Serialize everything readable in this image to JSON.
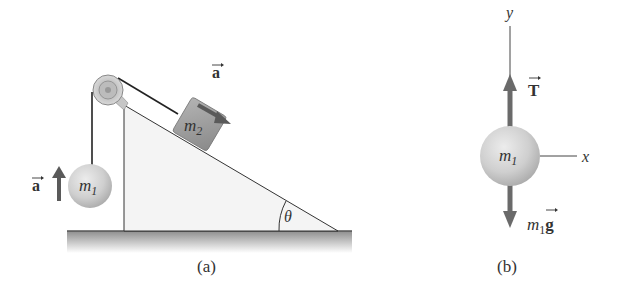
{
  "figure_a": {
    "caption": "(a)",
    "mass_hanging": {
      "label": "m",
      "subscript": "1"
    },
    "mass_incline": {
      "label": "m",
      "subscript": "2"
    },
    "accel_hanging": {
      "label": "a",
      "direction": "up"
    },
    "accel_incline": {
      "label": "a",
      "direction": "down-slope"
    },
    "angle": {
      "label": "θ"
    }
  },
  "figure_b": {
    "caption": "(b)",
    "mass": {
      "label": "m",
      "subscript": "1"
    },
    "axis_y": {
      "label": "y"
    },
    "axis_x": {
      "label": "x"
    },
    "tension": {
      "label": "T",
      "direction": "up"
    },
    "weight": {
      "prefix": "m",
      "subscript": "1",
      "label": "g",
      "direction": "down"
    }
  },
  "colors": {
    "arrow": "#5a5a5a",
    "ball": "#cfcfcf",
    "block": "#9a9a9a",
    "incline": "#f4f4f4",
    "ground": "#a8a8a8",
    "line": "#222222"
  }
}
